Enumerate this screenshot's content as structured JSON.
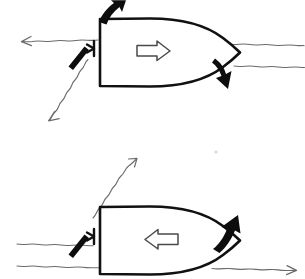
{
  "figure": {
    "background_color": "#ffffff",
    "ink_color": "#111111",
    "wave_color": "#6b6b6b",
    "hollow_arrow_color": "#ffffff",
    "width_px": 305,
    "height_px": 279
  },
  "panels": [
    {
      "id": "top",
      "name": "upper-diagram",
      "caption": "",
      "hull": {
        "name": "boat-hull-top-view",
        "heading": "bow-right",
        "transom_side": "left",
        "bow_side": "right"
      },
      "inner_arrow": {
        "name": "hull-direction-arrow",
        "direction": "right",
        "style": "hollow-outline",
        "meaning": "boat heading"
      },
      "stern_rudder": {
        "name": "rudder-indicator",
        "position": "stern",
        "style": "bracket"
      },
      "thruster": {
        "name": "propeller-blade",
        "position": "stern-port",
        "angle_deg": 55,
        "style": "solid-black-blade"
      },
      "thick_arrows": [
        {
          "name": "stern-force-arrow",
          "direction": "up-right",
          "position": "stern",
          "style": "solid-black-curved"
        },
        {
          "name": "bow-force-arrow",
          "direction": "down-right",
          "position": "bow",
          "style": "solid-black-curved"
        }
      ],
      "flow_arrows": [
        {
          "name": "current-arrow-left",
          "direction": "left",
          "style": "thin-wavy",
          "position": "port-beam"
        },
        {
          "name": "resultant-arrow-down-left",
          "direction": "down-left",
          "style": "thin-wavy-diagonal",
          "position": "stern-quarter"
        }
      ],
      "wave_lines": [
        {
          "name": "water-line-right-upper",
          "side": "right"
        },
        {
          "name": "water-line-right-lower",
          "side": "right"
        }
      ]
    },
    {
      "id": "bottom",
      "name": "lower-diagram",
      "caption": "",
      "hull": {
        "name": "boat-hull-top-view",
        "heading": "bow-right",
        "transom_side": "left",
        "bow_side": "right"
      },
      "inner_arrow": {
        "name": "hull-direction-arrow",
        "direction": "left",
        "style": "hollow-outline",
        "meaning": "boat heading"
      },
      "stern_rudder": {
        "name": "rudder-indicator",
        "position": "stern",
        "style": "bracket"
      },
      "thruster": {
        "name": "propeller-blade",
        "position": "stern-port",
        "angle_deg": 55,
        "style": "solid-black-blade"
      },
      "thick_arrows": [
        {
          "name": "bow-force-arrow",
          "direction": "up-right",
          "position": "bow",
          "style": "solid-black-curved"
        }
      ],
      "flow_arrows": [
        {
          "name": "resultant-arrow-up-right",
          "direction": "up-right",
          "style": "thin-wavy-diagonal",
          "position": "stern-quarter"
        },
        {
          "name": "current-arrow-right",
          "direction": "right",
          "style": "thin-wavy",
          "position": "starboard-lower"
        }
      ],
      "wave_lines": [
        {
          "name": "water-line-left-upper",
          "side": "left"
        },
        {
          "name": "water-line-left-lower",
          "side": "left"
        }
      ]
    }
  ]
}
